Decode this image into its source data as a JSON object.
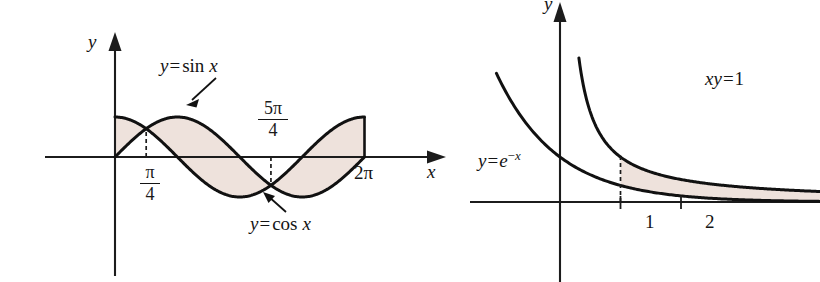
{
  "figure": {
    "background_color": "#ffffff",
    "shade_color": "#eee2dc",
    "curve_color": "#111111",
    "axis_color": "#1c1c1c"
  },
  "left_panel": {
    "y_axis_label": "y",
    "x_axis_label": "x",
    "sin_label": {
      "lhs": "y",
      "eq": "=",
      "fn": "sin",
      "arg": "x"
    },
    "cos_label": {
      "lhs": "y",
      "eq": "=",
      "fn": "cos",
      "arg": "x"
    },
    "tick_pi_over_4": {
      "numerator": "π",
      "denominator": "4"
    },
    "tick_5pi_over_4": {
      "numerator": "5π",
      "denominator": "4"
    },
    "tick_2pi": "2π"
  },
  "right_panel": {
    "y_axis_label": "y",
    "exp_label": {
      "lhs": "y",
      "eq": "=",
      "base": "e",
      "exp_sign": "−",
      "exp_var": "x"
    },
    "hyperbola_label": {
      "lhs": "xy",
      "eq": "=",
      "rhs": "1"
    },
    "tick_labels": [
      "1",
      "2"
    ]
  },
  "chart_data": [
    {
      "type": "line",
      "id": "left-sin-cos",
      "title": "Region between y = sin x and y = cos x on [0, 2π]",
      "xlabel": "x",
      "ylabel": "y",
      "xlim": [
        0,
        6.283185
      ],
      "ylim": [
        -1.15,
        1.15
      ],
      "grid": false,
      "legend": "inline-annotations",
      "x_ticks": [
        {
          "value": 0.785398,
          "label": "π/4"
        },
        {
          "value": 3.926991,
          "label": "5π/4"
        },
        {
          "value": 6.283185,
          "label": "2π"
        }
      ],
      "series": [
        {
          "name": "y = sin x",
          "formula": "sin(x)",
          "x_start": 0,
          "x_end": 6.283185
        },
        {
          "name": "y = cos x",
          "formula": "cos(x)",
          "x_start": 0,
          "x_end": 6.283185
        }
      ],
      "shaded_region": {
        "between": [
          "y = sin x",
          "y = cos x"
        ],
        "from": 0,
        "to": 6.283185,
        "crossings": [
          0.785398,
          3.926991
        ]
      },
      "annotations": [
        {
          "text": "y=sin x",
          "points_to": "sin curve"
        },
        {
          "text": "y=cos x",
          "points_to": "cos curve"
        }
      ]
    },
    {
      "type": "line",
      "id": "right-exp-hyperbola",
      "title": "Region between xy = 1 and y = e^{-x} for x ≥ 1",
      "xlabel": "",
      "ylabel": "y",
      "xlim": [
        -1.1,
        3.6
      ],
      "ylim": [
        -0.55,
        3.2
      ],
      "grid": false,
      "legend": "inline-annotations",
      "x_ticks": [
        {
          "value": 1,
          "label": "1"
        },
        {
          "value": 2,
          "label": "2"
        }
      ],
      "series": [
        {
          "name": "y = e^{-x}",
          "formula": "exp(-x)",
          "x_start": -1.05,
          "x_end": 3.55
        },
        {
          "name": "xy = 1",
          "formula": "1/x",
          "x_start": 0.38,
          "x_end": 3.55
        }
      ],
      "shaded_region": {
        "between": [
          "xy = 1",
          "y = e^{-x}"
        ],
        "from": 1,
        "to": 3.55,
        "left_boundary": "dashed vertical line at x = 1"
      },
      "annotations": [
        {
          "text": "xy=1",
          "points_to": "hyperbola"
        },
        {
          "text": "y=e^-x",
          "points_to": "exponential curve"
        }
      ]
    }
  ]
}
